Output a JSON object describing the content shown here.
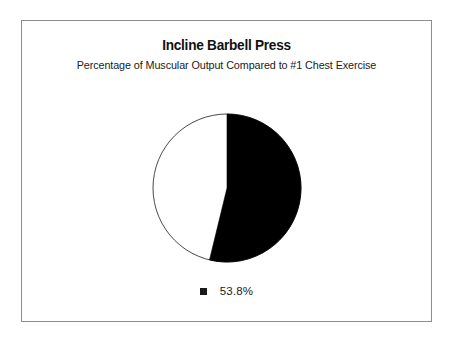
{
  "figure": {
    "title": "Incline Barbell Press",
    "subtitle": "Percentage of Muscular Output Compared to #1 Chest Exercise",
    "frame_color": "#8d8d8d",
    "background_color": "#ffffff"
  },
  "legend": {
    "items": [
      {
        "label": "53.8%",
        "color": "#1a1a1a",
        "marker": "filled-square"
      }
    ]
  },
  "chart_data": {
    "type": "pie",
    "title": "Incline Barbell Press",
    "subtitle": "Percentage of Muscular Output Compared to #1 Chest Exercise",
    "xlabel": "",
    "ylabel": "",
    "categories": [
      "53.8%",
      "Remainder"
    ],
    "values": [
      53.8,
      46.2
    ],
    "labels": [
      "53.8%",
      ""
    ],
    "colors": [
      "#000000",
      "#ffffff"
    ],
    "start_angle_deg": 90,
    "direction": "clockwise",
    "outline_color": "#000000",
    "legend_position": "bottom",
    "legend_entries": [
      "53.8%"
    ],
    "grid": false,
    "annotations": []
  }
}
